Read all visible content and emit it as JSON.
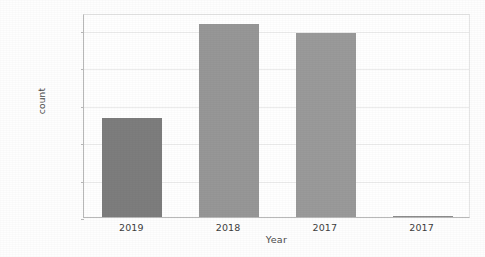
{
  "chart_data": {
    "type": "bar",
    "title": "",
    "xlabel": "Year",
    "ylabel": "count",
    "categories": [
      "2019",
      "2018",
      "2017",
      "2017"
    ],
    "values": [
      132000,
      258000,
      245000,
      1500
    ],
    "series": [
      {
        "name": "count",
        "values": [
          132000,
          258000,
          245000,
          1500
        ]
      }
    ],
    "bar_colors": [
      "#7d7d7d",
      "#979797",
      "#9a9a9a",
      "#8d8d8d"
    ],
    "ylim": [
      0,
      272000
    ],
    "yticks": [
      0,
      50000,
      100000,
      150000,
      200000,
      250000
    ],
    "ytick_labels": [
      "0",
      "50000",
      "100000",
      "150000",
      "200000",
      "250000"
    ],
    "xtick_labels": [
      "2019",
      "2018",
      "2017",
      "2017"
    ],
    "grid": true,
    "grid_axis": "y",
    "legend": null,
    "legend_position": "none",
    "background": "#ffffff",
    "annotations": []
  }
}
